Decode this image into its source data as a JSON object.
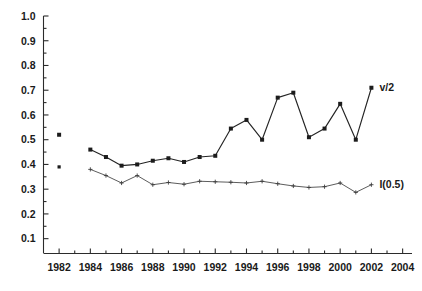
{
  "chart_data": {
    "type": "line",
    "title": "",
    "xlabel": "",
    "ylabel": "",
    "xlim": [
      1981,
      2004.6
    ],
    "ylim": [
      0.04,
      1.0
    ],
    "grid": false,
    "legend_position": "inline-right-of-series-end",
    "x_tick_labels": [
      "1982",
      "1984",
      "1986",
      "1988",
      "1990",
      "1992",
      "1994",
      "1996",
      "1998",
      "2000",
      "2002",
      "2004"
    ],
    "x_tick_values": [
      1982,
      1984,
      1986,
      1988,
      1990,
      1992,
      1994,
      1996,
      1998,
      2000,
      2002,
      2004
    ],
    "x_minor_tick_values": [
      1983,
      1985,
      1987,
      1989,
      1991,
      1993,
      1995,
      1997,
      1999,
      2001,
      2003
    ],
    "y_tick_labels": [
      "0.1",
      "0.2",
      "0.3",
      "0.4",
      "0.5",
      "0.6",
      "0.7",
      "0.8",
      "0.9",
      "1.0"
    ],
    "y_tick_values": [
      0.1,
      0.2,
      0.3,
      0.4,
      0.5,
      0.6,
      0.7,
      0.8,
      0.9,
      1.0
    ],
    "y_minor_tick_values": [
      0.15,
      0.25,
      0.35,
      0.45,
      0.55,
      0.65,
      0.75,
      0.85,
      0.95
    ],
    "series": [
      {
        "name": "v/2",
        "label": "v/2",
        "marker": "square",
        "color": "#1c1c1c",
        "detached_points": [
          {
            "x": 1982,
            "y": 0.52
          }
        ],
        "x": [
          1984,
          1985,
          1986,
          1987,
          1988,
          1989,
          1990,
          1991,
          1992,
          1993,
          1994,
          1995,
          1996,
          1997,
          1998,
          1999,
          2000,
          2001,
          2002
        ],
        "values": [
          0.46,
          0.43,
          0.395,
          0.4,
          0.415,
          0.425,
          0.41,
          0.43,
          0.435,
          0.545,
          0.58,
          0.5,
          0.67,
          0.69,
          0.51,
          0.545,
          0.645,
          0.5,
          0.71
        ]
      },
      {
        "name": "I(0.5)",
        "label": "I(0.5)",
        "marker": "cross",
        "color": "#3d3d3d",
        "detached_points": [
          {
            "x": 1982,
            "y": 0.39
          }
        ],
        "x": [
          1984,
          1985,
          1986,
          1987,
          1988,
          1989,
          1990,
          1991,
          1992,
          1993,
          1994,
          1995,
          1996,
          1997,
          1998,
          1999,
          2000,
          2001,
          2002
        ],
        "values": [
          0.38,
          0.355,
          0.325,
          0.355,
          0.318,
          0.327,
          0.32,
          0.332,
          0.33,
          0.328,
          0.325,
          0.332,
          0.322,
          0.313,
          0.307,
          0.31,
          0.325,
          0.287,
          0.318
        ]
      }
    ]
  }
}
